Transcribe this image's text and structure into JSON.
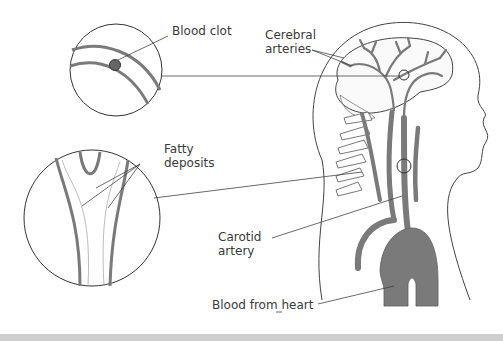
{
  "diagram": {
    "colors": {
      "artery": "#7a7a7a",
      "outline": "#333333",
      "background": "#ffffff",
      "bottom_bar": "#cfcfcf"
    },
    "labels": {
      "blood_clot": "Blood clot",
      "cerebral_arteries": "Cerebral\narteries",
      "fatty_deposits": "Fatty\ndeposits",
      "carotid_artery": "Carotid\nartery",
      "blood_from_heart": "Blood from heart"
    },
    "callouts": [
      {
        "name": "blood-clot-inset",
        "shows": "Blood clot"
      },
      {
        "name": "fatty-deposits-inset",
        "shows": "Fatty deposits"
      }
    ]
  }
}
